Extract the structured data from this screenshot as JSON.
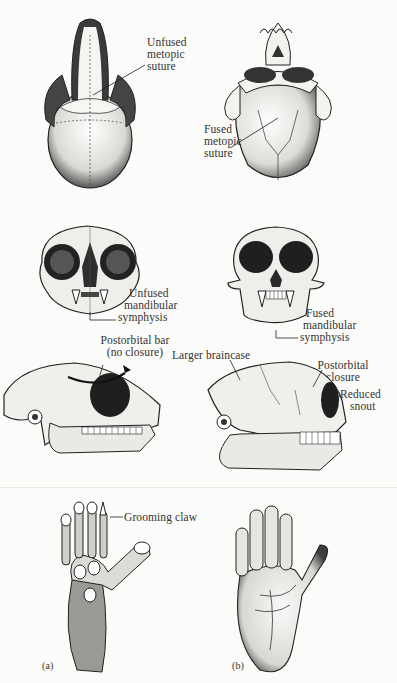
{
  "figure": {
    "colors": {
      "background": "#fbfbf9",
      "ink": "#2a2a2a",
      "shadow": "#555555",
      "bone": "#f2f2ee"
    },
    "panels": {
      "a": {
        "label": "(a)"
      },
      "b": {
        "label": "(b)"
      }
    },
    "rows": {
      "top_view": {
        "left": {
          "annotation": [
            "Unfused",
            "metopic",
            "suture"
          ]
        },
        "right": {
          "annotation": [
            "Fused",
            "metopic",
            "suture"
          ]
        }
      },
      "front_view": {
        "left": {
          "annotation": [
            "Unfused",
            "mandibular",
            "symphysis"
          ]
        },
        "right": {
          "annotation": [
            "Fused",
            "mandibular",
            "symphysis"
          ]
        }
      },
      "side_view": {
        "left": {
          "annotation": [
            "Postorbital bar",
            "(no closure)"
          ]
        },
        "right": {
          "braincase": "Larger braincase",
          "postorbital": [
            "Postorbital",
            "closure"
          ],
          "snout": [
            "Reduced",
            "snout"
          ]
        }
      },
      "hands": {
        "left": {
          "annotation": "Grooming claw"
        }
      }
    }
  }
}
